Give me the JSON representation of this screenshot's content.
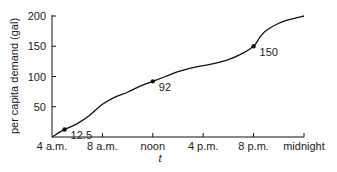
{
  "chart_data": {
    "type": "line",
    "title": "",
    "xlabel": "t",
    "ylabel": "per capita demand (gal)",
    "ylim": [
      0,
      200
    ],
    "yticks": [
      50,
      100,
      150,
      200
    ],
    "ytick_labels": [
      "50",
      "100",
      "150",
      "200"
    ],
    "xticks": [
      4,
      8,
      12,
      16,
      20,
      24
    ],
    "xtick_labels": [
      "4 a.m.",
      "8 a.m.",
      "noon",
      "4 p.m.",
      "8 p.m.",
      "midnight"
    ],
    "xlim": [
      4,
      24
    ],
    "grid": false,
    "series": [
      {
        "name": "per capita demand",
        "x": [
          4,
          5,
          6,
          7,
          8,
          9,
          10,
          11,
          12,
          13,
          14,
          15,
          16,
          17,
          18,
          19,
          20,
          20.5,
          21,
          22,
          23,
          24
        ],
        "values": [
          0,
          12.5,
          22,
          36,
          54,
          66,
          74,
          84,
          92,
          100,
          108,
          114,
          118,
          122,
          128,
          137,
          150,
          165,
          176,
          188,
          195,
          200
        ]
      }
    ],
    "annotations": [
      {
        "x": 5,
        "y": 12.5,
        "label": "12.5"
      },
      {
        "x": 12,
        "y": 92,
        "label": "92"
      },
      {
        "x": 20,
        "y": 150,
        "label": "150"
      }
    ]
  }
}
